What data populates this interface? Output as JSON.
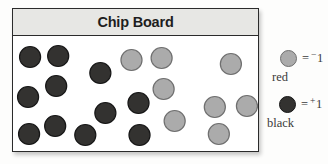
{
  "title": "Chip Board",
  "board": {
    "chip_radius": 10.5,
    "black_chips": {
      "meaning": "+1",
      "count": 11,
      "positions": [
        [
          17,
          21
        ],
        [
          45,
          20
        ],
        [
          87,
          37
        ],
        [
          43,
          50
        ],
        [
          15,
          61
        ],
        [
          125,
          67
        ],
        [
          92,
          77
        ],
        [
          42,
          90
        ],
        [
          16,
          98
        ],
        [
          72,
          99
        ],
        [
          126,
          99
        ]
      ]
    },
    "red_chips": {
      "meaning": "-1",
      "count": 8,
      "positions": [
        [
          118,
          24
        ],
        [
          148,
          22
        ],
        [
          217,
          28
        ],
        [
          150,
          53
        ],
        [
          201,
          71
        ],
        [
          233,
          70
        ],
        [
          161,
          85
        ],
        [
          205,
          98
        ]
      ]
    }
  },
  "legend": {
    "red": {
      "eq": "=",
      "sign": "−",
      "value": "1",
      "label": "red"
    },
    "black": {
      "eq": "=",
      "sign": "+",
      "value": "1",
      "label": "black"
    }
  },
  "colors": {
    "black_chip_fill": "#333230",
    "black_chip_stroke": "#161616",
    "red_chip_fill": "#ababab",
    "red_chip_stroke": "#6f6f6f",
    "header_bg": "#e7e7e4",
    "border": "#2b2b2b"
  }
}
